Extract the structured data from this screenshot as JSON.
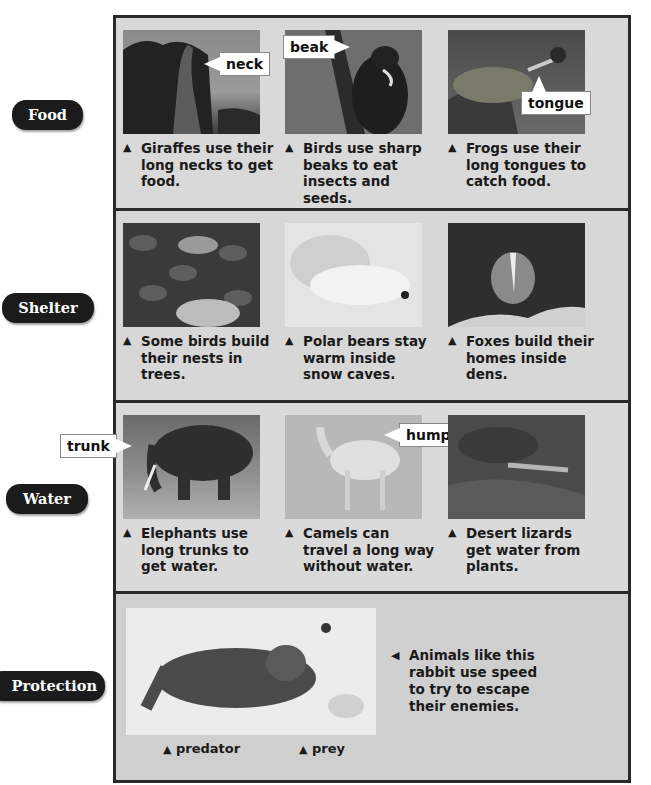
{
  "categories": [
    {
      "label": "Food"
    },
    {
      "label": "Shelter"
    },
    {
      "label": "Water"
    },
    {
      "label": "Protection"
    }
  ],
  "food": {
    "items": [
      {
        "caption": "Giraffes use their long necks to get food.",
        "callout": "neck",
        "image": "giraffe-photo"
      },
      {
        "caption": "Birds use sharp beaks to eat insects and seeds.",
        "callout": "beak",
        "image": "woodpecker-photo"
      },
      {
        "caption": "Frogs use their long tongues to catch food.",
        "callout": "tongue",
        "image": "frog-photo"
      }
    ]
  },
  "shelter": {
    "items": [
      {
        "caption": "Some birds build their nests in trees.",
        "image": "bird-nest-photo"
      },
      {
        "caption": "Polar bears stay warm inside snow caves.",
        "image": "polar-bear-photo"
      },
      {
        "caption": "Foxes build their homes inside dens.",
        "image": "fox-den-photo"
      }
    ]
  },
  "water": {
    "items": [
      {
        "caption": "Elephants use long trunks to get water.",
        "callout": "trunk",
        "image": "elephant-photo"
      },
      {
        "caption": "Camels can travel a long way without water.",
        "callout": "hump",
        "image": "camel-photo"
      },
      {
        "caption": "Desert lizards get water from plants.",
        "image": "lizard-photo"
      }
    ]
  },
  "protection": {
    "side_caption": "Animals like this rabbit use speed to try to escape their enemies.",
    "predator_label": "predator",
    "prey_label": "prey",
    "image": "lynx-rabbit-photo"
  },
  "glyphs": {
    "up_triangle": "▲",
    "left_triangle": "◀"
  },
  "colors": {
    "frame_border": "#2a2a2a",
    "panel_bg": "#d6d6d6",
    "category_pill": "#1b1b1b",
    "text": "#1a1a1a"
  }
}
